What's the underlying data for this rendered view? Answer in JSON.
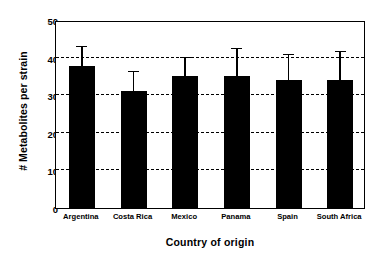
{
  "chart_data": {
    "type": "bar",
    "title": "",
    "xlabel": "Country of origin",
    "ylabel": "# Metabolites per strain",
    "categories": [
      "Argentina",
      "Costa Rica",
      "Mexico",
      "Panama",
      "Spain",
      "South Africa"
    ],
    "values": [
      37.8,
      31.2,
      35.0,
      35.2,
      34.0,
      34.0
    ],
    "errors": [
      5.0,
      5.0,
      4.8,
      7.0,
      6.8,
      7.6
    ],
    "error_type": "upper-only",
    "ylim": [
      0,
      50
    ],
    "yticks": [
      0,
      10,
      20,
      30,
      40,
      50
    ],
    "ytick_labels": [
      "0",
      "10",
      "20",
      "30",
      "40",
      "50"
    ],
    "grid": true,
    "grid_style": "dashed-horizontal",
    "grid_values": [
      10,
      20,
      30,
      40
    ],
    "legend": null,
    "bar_color": "#000000",
    "axis_color": "#000000",
    "background_color": "#ffffff"
  }
}
